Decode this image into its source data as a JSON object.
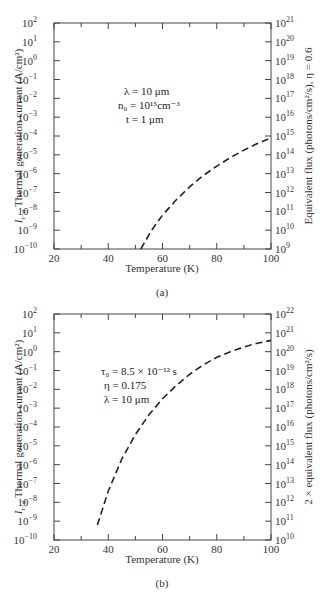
{
  "chart_data": [
    {
      "id": "a",
      "type": "line",
      "caption": "(a)",
      "xlabel": "Temperature (K)",
      "ylabel": "I_{t-g} Thermal generation current (A/cm²)",
      "ylabel_right": "Equivalent flux (photons/cm²/s), η = 0.6",
      "xlim": [
        20,
        100
      ],
      "ylim_log10": [
        -10,
        2
      ],
      "ylim_right_log10": [
        9,
        21
      ],
      "yscale": "log",
      "grid": false,
      "x_ticks": [
        20,
        40,
        60,
        80,
        100
      ],
      "x_minor_ticks": [
        30,
        50,
        70,
        90
      ],
      "y_tick_exponents": [
        2,
        1,
        0,
        -1,
        -2,
        -3,
        -4,
        -5,
        -6,
        -7,
        -8,
        -9,
        -10
      ],
      "y_right_tick_exponents": [
        21,
        20,
        19,
        18,
        17,
        16,
        15,
        14,
        13,
        12,
        11,
        10,
        9
      ],
      "annotations": [
        "λ = 10 μm",
        "n₀ = 10¹⁵ cm⁻³",
        "t = 1 μm"
      ],
      "series": [
        {
          "name": "thermal generation current",
          "style": "dashed",
          "x": [
            52,
            56,
            60,
            65,
            70,
            75,
            80,
            85,
            90,
            95,
            100
          ],
          "log10_y": [
            -10.0,
            -9.0,
            -8.2,
            -7.4,
            -6.7,
            -6.1,
            -5.6,
            -5.15,
            -4.75,
            -4.4,
            -4.1
          ]
        }
      ]
    },
    {
      "id": "b",
      "type": "line",
      "caption": "(b)",
      "xlabel": "Temperature (K)",
      "ylabel": "I_{t-g} Thermal generation current (A/cm²)",
      "ylabel_right": "2 × equivalent flux (photons/cm²/s)",
      "xlim": [
        20,
        100
      ],
      "ylim_log10": [
        -10,
        2
      ],
      "ylim_right_log10": [
        10,
        22
      ],
      "yscale": "log",
      "grid": false,
      "x_ticks": [
        20,
        40,
        60,
        80,
        100
      ],
      "x_minor_ticks": [
        30,
        50,
        70,
        90
      ],
      "y_tick_exponents": [
        2,
        1,
        0,
        -1,
        -2,
        -3,
        -4,
        -5,
        -6,
        -7,
        -8,
        -9,
        -10
      ],
      "y_right_tick_exponents": [
        22,
        21,
        20,
        19,
        18,
        17,
        16,
        15,
        14,
        13,
        12,
        11,
        10
      ],
      "annotations": [
        "τ₀ = 8.5 × 10⁻¹² s",
        "η = 0.175",
        "λ = 10 μm"
      ],
      "series": [
        {
          "name": "thermal generation current",
          "style": "dashed",
          "x": [
            36,
            40,
            45,
            50,
            55,
            60,
            65,
            70,
            75,
            80,
            85,
            90,
            95,
            100
          ],
          "log10_y": [
            -9.2,
            -7.4,
            -5.7,
            -4.4,
            -3.35,
            -2.5,
            -1.8,
            -1.2,
            -0.7,
            -0.3,
            0.0,
            0.25,
            0.45,
            0.6
          ]
        }
      ]
    }
  ],
  "panels": [
    {
      "caption": "(a)",
      "xlabel": "Temperature (K)",
      "ylabel_main": "Thermal generation current (A/cm²)",
      "ylabel_sym": "I",
      "ylabel_sub": "t−g",
      "ylabel_right": "Equivalent flux (photons/cm²/s), η = 0.6",
      "x_tick_labels": [
        "20",
        "40",
        "60",
        "80",
        "100"
      ],
      "annot": [
        "λ = 10 μm",
        "n₀ = 10¹⁵cm⁻³",
        "t = 1 μm"
      ]
    },
    {
      "caption": "(b)",
      "xlabel": "Temperature (K)",
      "ylabel_main": "Thermal generation current (A/cm²)",
      "ylabel_sym": "I",
      "ylabel_sub": "t−g",
      "ylabel_right": "2 × equivalent flux (photons/cm²/s)",
      "x_tick_labels": [
        "20",
        "40",
        "60",
        "80",
        "100"
      ],
      "annot": [
        "τ₀ = 8.5 × 10⁻¹² s",
        "η = 0.175",
        "λ = 10 μm"
      ]
    }
  ]
}
